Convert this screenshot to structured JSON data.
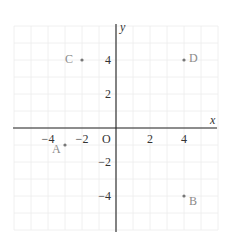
{
  "chart_data": {
    "type": "scatter",
    "title": "",
    "xlabel": "x",
    "ylabel": "y",
    "origin_label": "O",
    "xlim": [
      -6,
      6
    ],
    "ylim": [
      -6,
      6
    ],
    "grid": true,
    "x_ticks": [
      -4,
      -2,
      2,
      4
    ],
    "y_ticks": [
      4,
      2,
      -2,
      -4
    ],
    "x_tick_labels": [
      "−4",
      "−2",
      "2",
      "4"
    ],
    "y_tick_labels": [
      "4",
      "2",
      "−2",
      "−4"
    ],
    "points": [
      {
        "label": "A",
        "x": -3,
        "y": -1
      },
      {
        "label": "B",
        "x": 4,
        "y": -4
      },
      {
        "label": "C",
        "x": -2,
        "y": 4
      },
      {
        "label": "D",
        "x": 4,
        "y": 4
      }
    ]
  },
  "colors": {
    "axis": "#222222",
    "grid": "#ececec",
    "point": "#777777",
    "point_label": "#8a8a8a"
  }
}
